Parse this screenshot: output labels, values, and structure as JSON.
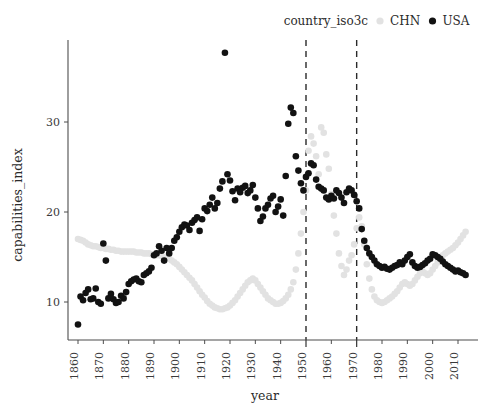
{
  "legend": {
    "title": "country_iso3c",
    "entries": [
      {
        "label": "CHN",
        "color": "#e2e2e2",
        "marker": "dot-icon"
      },
      {
        "label": "USA",
        "color": "#121212",
        "marker": "dot-icon"
      }
    ]
  },
  "axes": {
    "x_title": "year",
    "y_title": "capabilities_index",
    "x_ticks": [
      "1860",
      "1870",
      "1880",
      "1890",
      "1900",
      "1910",
      "1920",
      "1930",
      "1940",
      "1950",
      "1960",
      "1970",
      "1980",
      "1990",
      "2000",
      "2010"
    ],
    "y_ticks": [
      "10",
      "20",
      "30"
    ]
  },
  "annotations": {
    "vlines": [
      1950,
      1970
    ]
  },
  "chart_data": {
    "type": "scatter",
    "title": "",
    "xlabel": "year",
    "ylabel": "capabilities_index",
    "xlim": [
      1855,
      2017
    ],
    "ylim": [
      6,
      39
    ],
    "grid": false,
    "legend_position": "top-right",
    "legend_title": "country_iso3c",
    "vertical_reference_lines": [
      1950,
      1970
    ],
    "series": [
      {
        "name": "USA",
        "color": "#121212",
        "points": [
          [
            1860,
            7.5
          ],
          [
            1861,
            10.6
          ],
          [
            1862,
            10.2
          ],
          [
            1863,
            11.0
          ],
          [
            1864,
            11.4
          ],
          [
            1865,
            10.3
          ],
          [
            1866,
            10.4
          ],
          [
            1867,
            11.5
          ],
          [
            1868,
            10.0
          ],
          [
            1869,
            9.8
          ],
          [
            1870,
            16.5
          ],
          [
            1871,
            14.6
          ],
          [
            1872,
            10.4
          ],
          [
            1873,
            10.9
          ],
          [
            1874,
            10.3
          ],
          [
            1875,
            9.9
          ],
          [
            1876,
            10.0
          ],
          [
            1877,
            10.7
          ],
          [
            1878,
            10.4
          ],
          [
            1879,
            11.1
          ],
          [
            1880,
            12.0
          ],
          [
            1881,
            12.3
          ],
          [
            1882,
            12.5
          ],
          [
            1883,
            12.6
          ],
          [
            1884,
            12.3
          ],
          [
            1885,
            12.2
          ],
          [
            1886,
            13.0
          ],
          [
            1887,
            13.2
          ],
          [
            1888,
            13.4
          ],
          [
            1889,
            13.8
          ],
          [
            1890,
            15.2
          ],
          [
            1891,
            15.4
          ],
          [
            1892,
            16.2
          ],
          [
            1893,
            15.7
          ],
          [
            1894,
            14.6
          ],
          [
            1895,
            16.0
          ],
          [
            1896,
            15.4
          ],
          [
            1897,
            16.0
          ],
          [
            1898,
            16.8
          ],
          [
            1899,
            17.2
          ],
          [
            1900,
            17.8
          ],
          [
            1901,
            18.3
          ],
          [
            1902,
            18.6
          ],
          [
            1903,
            18.5
          ],
          [
            1904,
            18.0
          ],
          [
            1905,
            18.8
          ],
          [
            1906,
            19.1
          ],
          [
            1907,
            19.4
          ],
          [
            1908,
            17.9
          ],
          [
            1909,
            19.2
          ],
          [
            1910,
            20.4
          ],
          [
            1911,
            20.1
          ],
          [
            1912,
            20.8
          ],
          [
            1913,
            21.6
          ],
          [
            1914,
            20.4
          ],
          [
            1915,
            21.0
          ],
          [
            1916,
            22.6
          ],
          [
            1917,
            23.4
          ],
          [
            1918,
            37.7
          ],
          [
            1919,
            24.2
          ],
          [
            1920,
            23.5
          ],
          [
            1921,
            22.3
          ],
          [
            1922,
            21.3
          ],
          [
            1923,
            22.6
          ],
          [
            1924,
            22.2
          ],
          [
            1925,
            22.7
          ],
          [
            1926,
            22.9
          ],
          [
            1927,
            22.1
          ],
          [
            1928,
            22.4
          ],
          [
            1929,
            23.0
          ],
          [
            1930,
            21.6
          ],
          [
            1931,
            20.4
          ],
          [
            1932,
            19.0
          ],
          [
            1933,
            19.5
          ],
          [
            1934,
            20.4
          ],
          [
            1935,
            20.8
          ],
          [
            1936,
            21.5
          ],
          [
            1937,
            21.8
          ],
          [
            1938,
            20.0
          ],
          [
            1939,
            20.6
          ],
          [
            1940,
            21.4
          ],
          [
            1941,
            19.6
          ],
          [
            1942,
            24.0
          ],
          [
            1943,
            29.8
          ],
          [
            1944,
            31.6
          ],
          [
            1945,
            31.0
          ],
          [
            1946,
            26.2
          ],
          [
            1947,
            24.6
          ],
          [
            1948,
            23.2
          ],
          [
            1949,
            22.4
          ],
          [
            1950,
            23.9
          ],
          [
            1951,
            24.3
          ],
          [
            1952,
            25.4
          ],
          [
            1953,
            25.2
          ],
          [
            1954,
            23.6
          ],
          [
            1955,
            22.8
          ],
          [
            1956,
            22.6
          ],
          [
            1957,
            22.4
          ],
          [
            1958,
            21.6
          ],
          [
            1959,
            21.4
          ],
          [
            1960,
            21.8
          ],
          [
            1961,
            21.5
          ],
          [
            1962,
            22.4
          ],
          [
            1963,
            22.1
          ],
          [
            1964,
            21.6
          ],
          [
            1965,
            21.0
          ],
          [
            1966,
            22.2
          ],
          [
            1967,
            22.6
          ],
          [
            1968,
            22.4
          ],
          [
            1969,
            21.9
          ],
          [
            1970,
            21.2
          ],
          [
            1971,
            20.4
          ],
          [
            1972,
            18.1
          ],
          [
            1973,
            16.8
          ],
          [
            1974,
            16.0
          ],
          [
            1975,
            15.4
          ],
          [
            1976,
            15.0
          ],
          [
            1977,
            14.6
          ],
          [
            1978,
            14.2
          ],
          [
            1979,
            14.0
          ],
          [
            1980,
            13.8
          ],
          [
            1981,
            13.9
          ],
          [
            1982,
            13.7
          ],
          [
            1983,
            13.6
          ],
          [
            1984,
            13.8
          ],
          [
            1985,
            14.0
          ],
          [
            1986,
            14.1
          ],
          [
            1987,
            14.4
          ],
          [
            1988,
            14.2
          ],
          [
            1989,
            14.6
          ],
          [
            1990,
            15.0
          ],
          [
            1991,
            15.3
          ],
          [
            1992,
            14.4
          ],
          [
            1993,
            14.0
          ],
          [
            1994,
            13.8
          ],
          [
            1995,
            13.9
          ],
          [
            1996,
            14.1
          ],
          [
            1997,
            14.3
          ],
          [
            1998,
            14.6
          ],
          [
            1999,
            14.8
          ],
          [
            2000,
            15.3
          ],
          [
            2001,
            15.2
          ],
          [
            2002,
            15.0
          ],
          [
            2003,
            14.8
          ],
          [
            2004,
            14.5
          ],
          [
            2005,
            14.2
          ],
          [
            2006,
            14.0
          ],
          [
            2007,
            13.8
          ],
          [
            2008,
            13.6
          ],
          [
            2009,
            13.4
          ],
          [
            2010,
            13.5
          ],
          [
            2011,
            13.3
          ],
          [
            2012,
            13.2
          ],
          [
            2013,
            13.0
          ]
        ]
      },
      {
        "name": "CHN",
        "color": "#e2e2e2",
        "points": [
          [
            1860,
            17.0
          ],
          [
            1861,
            16.9
          ],
          [
            1862,
            16.8
          ],
          [
            1863,
            16.6
          ],
          [
            1864,
            16.4
          ],
          [
            1865,
            16.3
          ],
          [
            1866,
            16.2
          ],
          [
            1867,
            16.2
          ],
          [
            1868,
            16.1
          ],
          [
            1869,
            16.0
          ],
          [
            1870,
            16.0
          ],
          [
            1871,
            15.9
          ],
          [
            1872,
            15.9
          ],
          [
            1873,
            15.8
          ],
          [
            1874,
            15.8
          ],
          [
            1875,
            15.7
          ],
          [
            1876,
            15.7
          ],
          [
            1877,
            15.6
          ],
          [
            1878,
            15.6
          ],
          [
            1879,
            15.6
          ],
          [
            1880,
            15.6
          ],
          [
            1881,
            15.6
          ],
          [
            1882,
            15.6
          ],
          [
            1883,
            15.5
          ],
          [
            1884,
            15.5
          ],
          [
            1885,
            15.5
          ],
          [
            1886,
            15.4
          ],
          [
            1887,
            15.4
          ],
          [
            1888,
            15.4
          ],
          [
            1889,
            15.3
          ],
          [
            1890,
            15.3
          ],
          [
            1891,
            15.2
          ],
          [
            1892,
            15.2
          ],
          [
            1893,
            15.1
          ],
          [
            1894,
            15.0
          ],
          [
            1895,
            14.9
          ],
          [
            1896,
            14.8
          ],
          [
            1897,
            14.6
          ],
          [
            1898,
            14.4
          ],
          [
            1899,
            14.2
          ],
          [
            1900,
            13.9
          ],
          [
            1901,
            13.6
          ],
          [
            1902,
            13.3
          ],
          [
            1903,
            13.0
          ],
          [
            1904,
            12.7
          ],
          [
            1905,
            12.4
          ],
          [
            1906,
            12.0
          ],
          [
            1907,
            11.6
          ],
          [
            1908,
            11.2
          ],
          [
            1909,
            10.8
          ],
          [
            1910,
            10.5
          ],
          [
            1911,
            10.1
          ],
          [
            1912,
            9.8
          ],
          [
            1913,
            9.6
          ],
          [
            1914,
            9.4
          ],
          [
            1915,
            9.3
          ],
          [
            1916,
            9.2
          ],
          [
            1917,
            9.2
          ],
          [
            1918,
            9.3
          ],
          [
            1919,
            9.4
          ],
          [
            1920,
            9.6
          ],
          [
            1921,
            9.9
          ],
          [
            1922,
            10.2
          ],
          [
            1923,
            10.6
          ],
          [
            1924,
            11.0
          ],
          [
            1925,
            11.4
          ],
          [
            1926,
            11.8
          ],
          [
            1927,
            12.2
          ],
          [
            1928,
            12.4
          ],
          [
            1929,
            12.6
          ],
          [
            1930,
            12.4
          ],
          [
            1931,
            12.0
          ],
          [
            1932,
            11.6
          ],
          [
            1933,
            11.2
          ],
          [
            1934,
            10.8
          ],
          [
            1935,
            10.4
          ],
          [
            1936,
            10.2
          ],
          [
            1937,
            10.0
          ],
          [
            1938,
            9.8
          ],
          [
            1939,
            9.8
          ],
          [
            1940,
            9.9
          ],
          [
            1941,
            10.1
          ],
          [
            1942,
            10.4
          ],
          [
            1943,
            10.8
          ],
          [
            1944,
            11.4
          ],
          [
            1945,
            12.2
          ],
          [
            1946,
            13.6
          ],
          [
            1947,
            15.4
          ],
          [
            1948,
            17.6
          ],
          [
            1949,
            20.0
          ],
          [
            1950,
            22.4
          ],
          [
            1951,
            26.8
          ],
          [
            1952,
            28.4
          ],
          [
            1953,
            27.6
          ],
          [
            1954,
            26.2
          ],
          [
            1955,
            24.2
          ],
          [
            1956,
            29.4
          ],
          [
            1957,
            28.8
          ],
          [
            1958,
            26.4
          ],
          [
            1959,
            24.8
          ],
          [
            1960,
            22.0
          ],
          [
            1961,
            19.6
          ],
          [
            1962,
            17.6
          ],
          [
            1963,
            15.4
          ],
          [
            1964,
            14.0
          ],
          [
            1965,
            13.0
          ],
          [
            1966,
            13.6
          ],
          [
            1967,
            14.6
          ],
          [
            1968,
            15.2
          ],
          [
            1969,
            16.4
          ],
          [
            1970,
            18.2
          ],
          [
            1971,
            19.4
          ],
          [
            1972,
            18.4
          ],
          [
            1973,
            16.4
          ],
          [
            1974,
            14.2
          ],
          [
            1975,
            12.6
          ],
          [
            1976,
            11.4
          ],
          [
            1977,
            10.6
          ],
          [
            1978,
            10.2
          ],
          [
            1979,
            10.0
          ],
          [
            1980,
            9.9
          ],
          [
            1981,
            10.0
          ],
          [
            1982,
            10.2
          ],
          [
            1983,
            10.4
          ],
          [
            1984,
            10.6
          ],
          [
            1985,
            10.9
          ],
          [
            1986,
            11.2
          ],
          [
            1987,
            11.6
          ],
          [
            1988,
            12.0
          ],
          [
            1989,
            12.2
          ],
          [
            1990,
            12.0
          ],
          [
            1991,
            11.8
          ],
          [
            1992,
            12.0
          ],
          [
            1993,
            12.4
          ],
          [
            1994,
            12.8
          ],
          [
            1995,
            13.2
          ],
          [
            1996,
            13.4
          ],
          [
            1997,
            13.2
          ],
          [
            1998,
            13.0
          ],
          [
            1999,
            13.2
          ],
          [
            2000,
            13.6
          ],
          [
            2001,
            14.0
          ],
          [
            2002,
            14.4
          ],
          [
            2003,
            14.8
          ],
          [
            2004,
            15.2
          ],
          [
            2005,
            15.4
          ],
          [
            2006,
            15.6
          ],
          [
            2007,
            15.8
          ],
          [
            2008,
            16.0
          ],
          [
            2009,
            16.3
          ],
          [
            2010,
            16.6
          ],
          [
            2011,
            17.0
          ],
          [
            2012,
            17.4
          ],
          [
            2013,
            17.8
          ]
        ]
      }
    ]
  }
}
